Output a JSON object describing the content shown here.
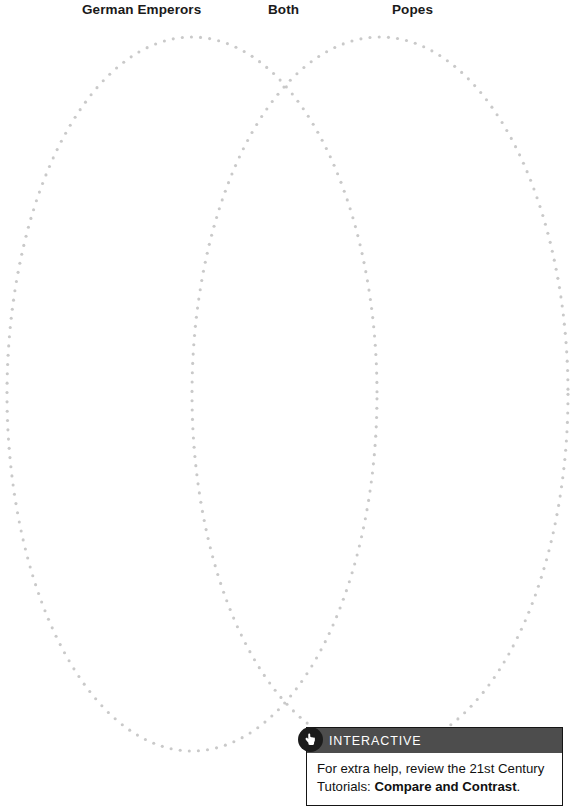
{
  "page": {
    "background_color": "#ffffff",
    "width": 588,
    "height": 806
  },
  "headings": {
    "left": "German Emperors",
    "middle": "Both",
    "right": "Popes"
  },
  "venn": {
    "dot_color": "#c9c9c9",
    "left_circle": {
      "cx": 192,
      "cy": 394,
      "rx": 185,
      "ry": 357,
      "label": "German Emperors"
    },
    "right_circle": {
      "cx": 380,
      "cy": 394,
      "rx": 188,
      "ry": 357,
      "label": "Popes"
    }
  },
  "callout": {
    "icon": "pointing-hand-icon",
    "header_label": "INTERACTIVE",
    "header_bg": "#4d4d4d",
    "body_text_start": "For extra help, review the 21st Century Tutorials: ",
    "body_text_bold": "Compare and Contrast",
    "body_text_end": "."
  },
  "copyright": {
    "text": "© Pearson Education, Inc., All Rights Reserved"
  }
}
